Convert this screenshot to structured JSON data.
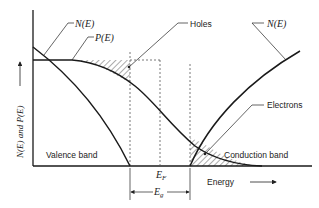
{
  "diagram": {
    "type": "band diagram",
    "y_axis_label": "N(E) and P(E)",
    "x_axis_label": "Energy",
    "labels": {
      "n_e_left": "N(E)",
      "p_e": "P(E)",
      "holes": "Holes",
      "n_e_right": "N(E)",
      "electrons": "Electrons",
      "valence_band": "Valence band",
      "conduction_band": "Conduction band",
      "fermi_level": "E",
      "fermi_sub": "F",
      "band_gap": "E",
      "band_gap_sub": "g"
    },
    "colors": {
      "line": "#1a1a1a",
      "dashed": "#555555",
      "hatch": "#444444",
      "background": "#ffffff"
    }
  }
}
